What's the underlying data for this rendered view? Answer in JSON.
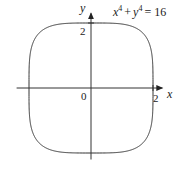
{
  "chart_data": {
    "type": "line",
    "title": "",
    "equation": {
      "base_x": "x",
      "exp_x": "4",
      "plus": "+",
      "base_y": "y",
      "exp_y": "4",
      "rhs": "= 16"
    },
    "curve": "x^4 + y^4 = 16",
    "xlabel": "x",
    "ylabel": "y",
    "origin_label": "0",
    "xtick_labels": [
      "2"
    ],
    "ytick_labels": [
      "2"
    ],
    "xlim": [
      -2.4,
      2.3
    ],
    "ylim": [
      -2.2,
      2.3
    ],
    "xticks": [
      2
    ],
    "yticks": [
      2
    ],
    "grid": false,
    "legend": "none",
    "series": [
      {
        "name": "x^4 + y^4 = 16",
        "exponent": 4,
        "radius": 2
      }
    ]
  }
}
